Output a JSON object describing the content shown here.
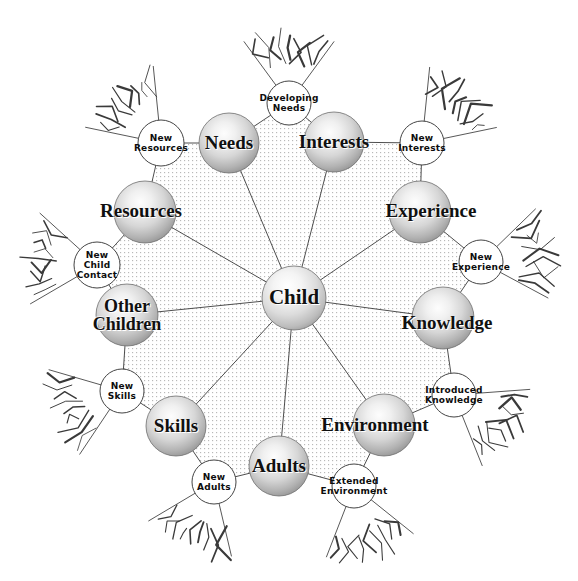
{
  "diagram": {
    "center": {
      "label": "Child",
      "cx": 294,
      "cy": 298,
      "r": 32,
      "font_size": 21
    },
    "colors": {
      "sphere_edge": "#6e6e6e",
      "sphere_light": "#ffffff",
      "sphere_mid": "#d2d2d2",
      "sphere_dark": "#8d8d8d",
      "line": "#3a3a3a",
      "dot_fill": "#b9b9b9",
      "text": "#101010",
      "background": "#ffffff"
    },
    "major_nodes": [
      {
        "id": "needs",
        "label": "Needs",
        "cx": 229,
        "cy": 143,
        "r": 30,
        "angle": -108,
        "font_size": 19,
        "label_dx": 0,
        "label_dy": 0
      },
      {
        "id": "interests",
        "label": "Interests",
        "cx": 334,
        "cy": 142,
        "r": 30,
        "angle": -71,
        "font_size": 19,
        "label_dx": 0,
        "label_dy": 0
      },
      {
        "id": "experience",
        "label": "Experience",
        "cx": 420,
        "cy": 212,
        "r": 31,
        "angle": -35,
        "font_size": 19,
        "label_dx": 11,
        "label_dy": -1
      },
      {
        "id": "knowledge",
        "label": "Knowledge",
        "cx": 443,
        "cy": 318,
        "r": 31,
        "angle": 3,
        "font_size": 19,
        "label_dx": 4,
        "label_dy": 5
      },
      {
        "id": "environment",
        "label": "Environment",
        "cx": 384,
        "cy": 425,
        "r": 31,
        "angle": 40,
        "font_size": 19,
        "label_dx": -9,
        "label_dy": 0
      },
      {
        "id": "adults",
        "label": "Adults",
        "cx": 279,
        "cy": 466,
        "r": 30,
        "angle": 76,
        "font_size": 19,
        "label_dx": 0,
        "label_dy": 0
      },
      {
        "id": "skills",
        "label": "Skills",
        "cx": 176,
        "cy": 426,
        "r": 30,
        "angle": 112,
        "font_size": 19,
        "label_dx": 0,
        "label_dy": 0
      },
      {
        "id": "other-children",
        "label": "Other\nChildren",
        "cx": 127,
        "cy": 315,
        "r": 31,
        "angle": 150,
        "font_size": 18,
        "label_dx": 0,
        "label_dy": 0
      },
      {
        "id": "resources",
        "label": "Resources",
        "cx": 145,
        "cy": 212,
        "r": 31,
        "angle": -147,
        "font_size": 19,
        "label_dx": -4,
        "label_dy": -1
      }
    ],
    "minor_nodes": [
      {
        "id": "developing-needs",
        "label": "Developing\nNeeds",
        "cx": 289,
        "cy": 103,
        "r": 22,
        "burst_angle": -90,
        "font_size": 9
      },
      {
        "id": "new-interests",
        "label": "New\nInterests",
        "cx": 422,
        "cy": 143,
        "r": 22,
        "burst_angle": -48,
        "font_size": 9
      },
      {
        "id": "new-experience",
        "label": "New\nExperience",
        "cx": 481,
        "cy": 262,
        "r": 22,
        "burst_angle": -8,
        "font_size": 9
      },
      {
        "id": "introduced-knowledge",
        "label": "Introduced\nKnowledge",
        "cx": 454,
        "cy": 395,
        "r": 22,
        "burst_angle": 32,
        "font_size": 9
      },
      {
        "id": "extended-environment",
        "label": "Extended\nEnvironment",
        "cx": 354,
        "cy": 486,
        "r": 22,
        "burst_angle": 75,
        "font_size": 9
      },
      {
        "id": "new-adults",
        "label": "New\nAdults",
        "cx": 214,
        "cy": 482,
        "r": 22,
        "burst_angle": 113,
        "font_size": 9
      },
      {
        "id": "new-skills",
        "label": "New\nSkills",
        "cx": 122,
        "cy": 391,
        "r": 22,
        "burst_angle": 160,
        "font_size": 9
      },
      {
        "id": "new-child-contact",
        "label": "New\nChild\nContact",
        "cx": 97,
        "cy": 265,
        "r": 23,
        "burst_angle": 186,
        "font_size": 9
      },
      {
        "id": "new-resources",
        "label": "New\nResources",
        "cx": 161,
        "cy": 143,
        "r": 23,
        "burst_angle": -132,
        "font_size": 9
      }
    ]
  }
}
